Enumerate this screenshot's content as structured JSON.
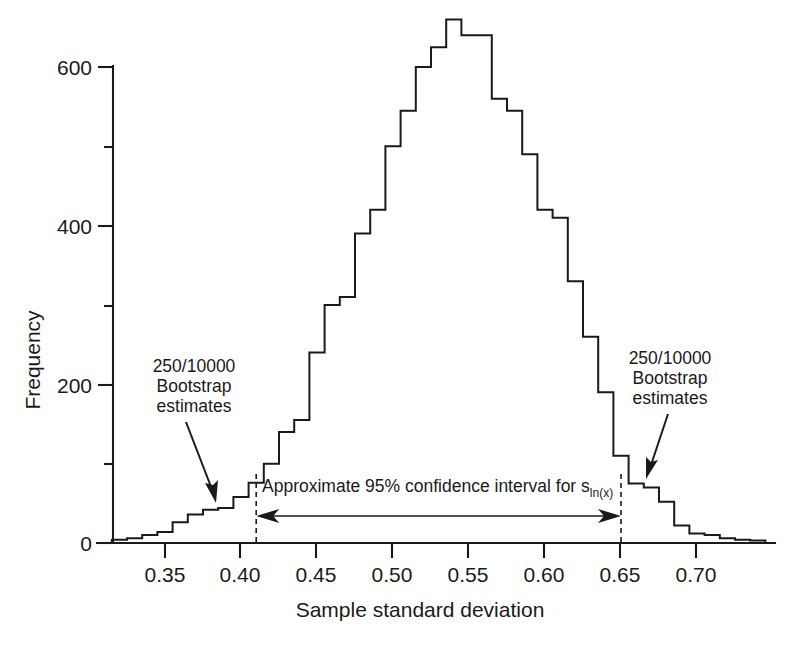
{
  "chart_data": {
    "type": "bar",
    "title": "",
    "xlabel": "Sample standard deviation",
    "ylabel": "Frequency",
    "xlim": [
      0.315,
      0.745
    ],
    "ylim": [
      0,
      680
    ],
    "grid": false,
    "legend": null,
    "bin_width": 0.01,
    "xticks": [
      "0.35",
      "0.40",
      "0.45",
      "0.50",
      "0.55",
      "0.60",
      "0.65",
      "0.70"
    ],
    "xtick_values": [
      0.35,
      0.4,
      0.45,
      0.5,
      0.55,
      0.6,
      0.65,
      0.7
    ],
    "yticks": [
      "0",
      "200",
      "400",
      "600"
    ],
    "ytick_values": [
      0,
      200,
      400,
      600
    ],
    "yticks_minor": [
      100,
      300,
      500
    ],
    "x": [
      0.315,
      0.325,
      0.335,
      0.345,
      0.355,
      0.365,
      0.375,
      0.385,
      0.395,
      0.405,
      0.415,
      0.425,
      0.435,
      0.445,
      0.455,
      0.465,
      0.475,
      0.485,
      0.495,
      0.505,
      0.515,
      0.525,
      0.535,
      0.545,
      0.555,
      0.565,
      0.575,
      0.585,
      0.595,
      0.605,
      0.615,
      0.625,
      0.635,
      0.645,
      0.655,
      0.665,
      0.675,
      0.685,
      0.695,
      0.705,
      0.715,
      0.725,
      0.735
    ],
    "values": [
      4,
      6,
      10,
      14,
      26,
      36,
      42,
      44,
      58,
      76,
      100,
      140,
      155,
      240,
      300,
      310,
      390,
      420,
      500,
      545,
      600,
      625,
      660,
      640,
      640,
      560,
      545,
      490,
      420,
      410,
      330,
      260,
      190,
      110,
      75,
      70,
      52,
      22,
      12,
      10,
      6,
      4,
      3
    ],
    "annotations": [
      {
        "name": "left-bootstrap-note",
        "lines": [
          "250/10000",
          "Bootstrap",
          "estimates"
        ],
        "points_to": 0.382
      },
      {
        "name": "right-bootstrap-note",
        "lines": [
          "250/10000",
          "Bootstrap",
          "estimates"
        ],
        "points_to": 0.663
      },
      {
        "name": "confidence-interval-label",
        "text": "Approximate 95% confidence interval for s",
        "subscript": "ln(x)",
        "interval_low": 0.41,
        "interval_high": 0.65
      }
    ]
  },
  "axes": {
    "y_label": "Frequency",
    "x_label": "Sample standard deviation",
    "y_tick_labels": [
      "600",
      "400",
      "200",
      "0"
    ],
    "x_tick_labels": [
      "0.35",
      "0.40",
      "0.45",
      "0.50",
      "0.55",
      "0.60",
      "0.65",
      "0.70"
    ]
  },
  "annotations": {
    "left_note_line1": "250/10000",
    "left_note_line2": "Bootstrap",
    "left_note_line3": "estimates",
    "right_note_line1": "250/10000",
    "right_note_line2": "Bootstrap",
    "right_note_line3": "estimates",
    "ci_text": "Approximate 95% confidence interval for s",
    "ci_subscript": "ln(x)"
  },
  "colors": {
    "ink": "#1a1a1a",
    "background": "#ffffff"
  }
}
